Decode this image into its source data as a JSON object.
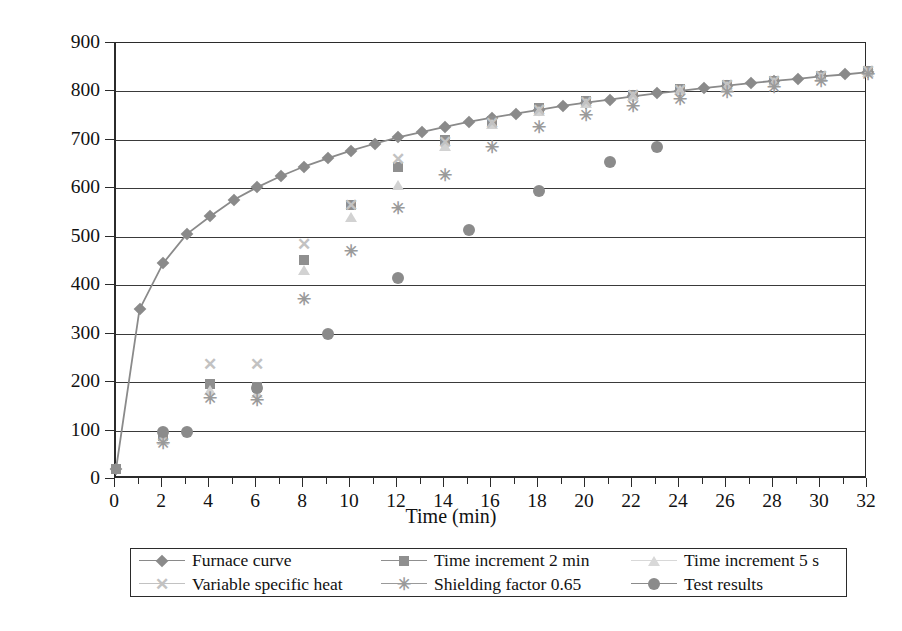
{
  "chart_data": {
    "type": "line",
    "title": "",
    "xlabel": "Time (min)",
    "ylabel": "Temperature (°C)",
    "xlim": [
      0,
      32
    ],
    "ylim": [
      0,
      900
    ],
    "xtick_step": 2,
    "ytick_step": 100,
    "xticks": [
      0,
      2,
      4,
      6,
      8,
      10,
      12,
      14,
      16,
      18,
      20,
      22,
      24,
      26,
      28,
      30,
      32
    ],
    "yticks": [
      0,
      100,
      200,
      300,
      400,
      500,
      600,
      700,
      800,
      900
    ],
    "minor_xticks_every": 1,
    "grid": "horizontal",
    "legend_position": "below-plot",
    "legend_columns": 3,
    "series": [
      {
        "name": "Furnace curve",
        "marker": "diamond",
        "color": "#8a8a8a",
        "line": true,
        "x": [
          0,
          1,
          2,
          3,
          4,
          5,
          6,
          7,
          8,
          9,
          10,
          11,
          12,
          13,
          14,
          15,
          16,
          17,
          18,
          19,
          20,
          21,
          22,
          23,
          24,
          25,
          26,
          27,
          28,
          29,
          30,
          31,
          32
        ],
        "y": [
          20,
          350,
          445,
          505,
          542,
          576,
          602,
          625,
          645,
          662,
          678,
          692,
          705,
          716,
          727,
          737,
          746,
          754,
          762,
          770,
          777,
          783,
          790,
          796,
          801,
          807,
          812,
          817,
          822,
          826,
          831,
          835,
          840
        ]
      },
      {
        "name": "Time increment 2 min",
        "marker": "square",
        "color": "#8f8f8f",
        "line": false,
        "x": [
          0,
          2,
          4,
          6,
          8,
          10,
          12,
          14,
          16,
          18,
          20,
          22,
          24,
          26,
          28,
          30,
          32
        ],
        "y": [
          20,
          88,
          196,
          190,
          452,
          565,
          645,
          700,
          740,
          765,
          780,
          793,
          805,
          814,
          822,
          832,
          843
        ]
      },
      {
        "name": "Time increment 5 s",
        "marker": "triangle",
        "color": "#d2d2d2",
        "line": false,
        "x": [
          2,
          4,
          6,
          8,
          10,
          12,
          14,
          16,
          18,
          20,
          22,
          24,
          26,
          28,
          30,
          32
        ],
        "y": [
          80,
          183,
          178,
          432,
          540,
          607,
          688,
          733,
          760,
          777,
          790,
          802,
          812,
          820,
          830,
          841
        ]
      },
      {
        "name": "Variable specific heat",
        "marker": "x",
        "color": "#c2c2c2",
        "line": false,
        "x": [
          2,
          4,
          6,
          8,
          10,
          12,
          14,
          16,
          18,
          20,
          22,
          24,
          26,
          28,
          30,
          32
        ],
        "y": [
          88,
          238,
          238,
          485,
          565,
          660,
          695,
          735,
          762,
          779,
          792,
          803,
          813,
          821,
          831,
          842
        ]
      },
      {
        "name": "Shielding factor 0.65",
        "marker": "star",
        "color": "#9a9a9a",
        "line": false,
        "x": [
          2,
          4,
          6,
          8,
          10,
          12,
          14,
          16,
          18,
          20,
          22,
          24,
          26,
          28,
          30,
          32
        ],
        "y": [
          75,
          167,
          163,
          372,
          470,
          560,
          628,
          685,
          726,
          752,
          770,
          785,
          798,
          810,
          822,
          835
        ]
      },
      {
        "name": "Test results",
        "marker": "circle",
        "color": "#8b8b8b",
        "line": false,
        "x": [
          2,
          3,
          6,
          9,
          12,
          15,
          18,
          21,
          23
        ],
        "y": [
          97,
          97,
          188,
          300,
          415,
          515,
          595,
          655,
          685
        ]
      }
    ]
  },
  "axes": {
    "y_title": "Temperature (°C)",
    "x_title": "Time (min)",
    "y_labels": [
      "900",
      "800",
      "700",
      "600",
      "500",
      "400",
      "300",
      "200",
      "100",
      "0"
    ],
    "x_labels": [
      "0",
      "2",
      "4",
      "6",
      "8",
      "10",
      "12",
      "14",
      "16",
      "18",
      "20",
      "22",
      "24",
      "26",
      "28",
      "30",
      "32"
    ]
  },
  "legend": {
    "items": [
      {
        "label": "Furnace curve",
        "marker": "diamond",
        "color": "#8a8a8a",
        "faint": false
      },
      {
        "label": "Time increment 2 min",
        "marker": "square",
        "color": "#8f8f8f",
        "faint": false
      },
      {
        "label": "Time increment 5 s",
        "marker": "triangle",
        "color": "#d8d8d8",
        "faint": true
      },
      {
        "label": "Variable specific heat",
        "marker": "x",
        "color": "#c2c2c2",
        "faint": true
      },
      {
        "label": "Shielding factor 0.65",
        "marker": "star",
        "color": "#9a9a9a",
        "faint": false
      },
      {
        "label": "Test results",
        "marker": "circle",
        "color": "#8b8b8b",
        "faint": false
      }
    ]
  }
}
